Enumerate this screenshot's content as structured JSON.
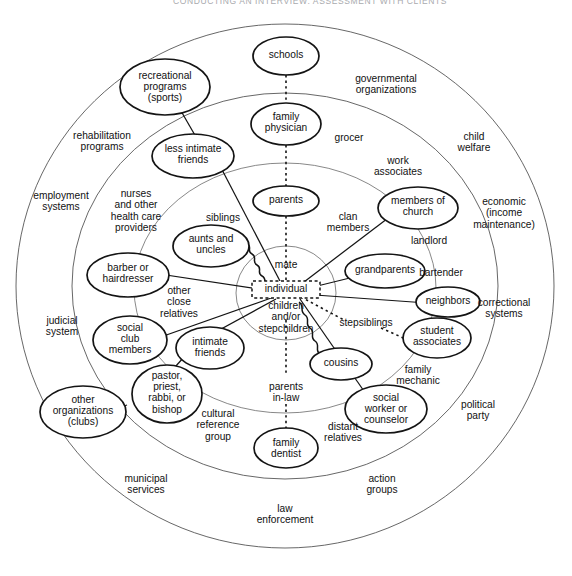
{
  "header": {
    "running_head": "CONDUCTING AN INTERVIEW: ASSESSMENT WITH CLIENTS"
  },
  "diagram": {
    "type": "ecomap",
    "center_label": "individual",
    "rings": [
      {
        "name": "nuclear-family-circle",
        "label": ""
      },
      {
        "name": "extended-family-ring",
        "label": ""
      },
      {
        "name": "informal-supports-ring",
        "label": ""
      },
      {
        "name": "formal-organizations-ring",
        "label": ""
      }
    ],
    "center": {
      "individual": "individual",
      "mate": "mate",
      "children": "children\nand/or\nstepchildren"
    },
    "inner_labels": [
      {
        "name": "mate",
        "text": "mate"
      },
      {
        "name": "children-or-stepchildren",
        "text": "children and/or stepchildren"
      }
    ],
    "family_ring_labels": [
      {
        "name": "siblings",
        "text": "siblings"
      },
      {
        "name": "clan-members",
        "text": "clan members"
      },
      {
        "name": "other-close-relatives",
        "text": "other close relatives"
      },
      {
        "name": "stepsiblings",
        "text": "stepsiblings"
      },
      {
        "name": "parents-in-law",
        "text": "parents in-law"
      },
      {
        "name": "distant-relatives",
        "text": "distant relatives"
      }
    ],
    "informal_ring_labels": [
      {
        "name": "grocer",
        "text": "grocer"
      },
      {
        "name": "work-associates",
        "text": "work associates"
      },
      {
        "name": "landlord",
        "text": "landlord"
      },
      {
        "name": "bartender",
        "text": "bartender"
      },
      {
        "name": "family-mechanic",
        "text": "family mechanic"
      },
      {
        "name": "cultural-reference-group",
        "text": "cultural reference group"
      },
      {
        "name": "nurses-and-other-health-care-providers",
        "text": "nurses and other health care providers"
      }
    ],
    "formal_ring_labels": [
      {
        "name": "governmental-organizations",
        "text": "governmental organizations"
      },
      {
        "name": "child-welfare",
        "text": "child welfare"
      },
      {
        "name": "economic-income-maintenance",
        "text": "economic (income maintenance)"
      },
      {
        "name": "correctional-systems",
        "text": "correctional systems"
      },
      {
        "name": "political-party",
        "text": "political party"
      },
      {
        "name": "action-groups",
        "text": "action groups"
      },
      {
        "name": "law-enforcement",
        "text": "law enforcement"
      },
      {
        "name": "municipal-services",
        "text": "municipal services"
      },
      {
        "name": "judicial-system",
        "text": "judicial system"
      },
      {
        "name": "employment-systems",
        "text": "employment systems"
      },
      {
        "name": "rehabilitation-programs",
        "text": "rehabilitation programs"
      }
    ],
    "nodes": [
      {
        "name": "schools",
        "text": "schools"
      },
      {
        "name": "recreational-programs-sports",
        "text": "recreational programs (sports)"
      },
      {
        "name": "family-physician",
        "text": "family physician"
      },
      {
        "name": "less-intimate-friends",
        "text": "less intimate friends"
      },
      {
        "name": "parents",
        "text": "parents"
      },
      {
        "name": "members-of-church",
        "text": "members of church"
      },
      {
        "name": "aunts-and-uncles",
        "text": "aunts and uncles"
      },
      {
        "name": "barber-or-hairdresser",
        "text": "barber or hairdresser"
      },
      {
        "name": "grandparents",
        "text": "grandparents"
      },
      {
        "name": "neighbors",
        "text": "neighbors"
      },
      {
        "name": "student-associates",
        "text": "student associates"
      },
      {
        "name": "social-club-members",
        "text": "social club members"
      },
      {
        "name": "intimate-friends",
        "text": "intimate friends"
      },
      {
        "name": "cousins",
        "text": "cousins"
      },
      {
        "name": "pastor-priest-rabbi-or-bishop",
        "text": "pastor, priest, rabbi, or bishop"
      },
      {
        "name": "other-organizations-clubs",
        "text": "other organizations (clubs)"
      },
      {
        "name": "social-worker-or-counselor",
        "text": "social worker or counselor"
      },
      {
        "name": "family-dentist",
        "text": "family dentist"
      }
    ],
    "connections": [
      {
        "from": "schools",
        "to": "family-physician",
        "style": "dotted"
      },
      {
        "from": "family-physician",
        "to": "parents",
        "style": "dotted"
      },
      {
        "from": "parents",
        "to": "individual",
        "style": "dotted"
      },
      {
        "from": "individual",
        "to": "parents-in-law",
        "style": "dotted"
      },
      {
        "from": "parents-in-law",
        "to": "family-dentist",
        "style": "dotted"
      },
      {
        "from": "individual",
        "to": "stepsiblings",
        "style": "dotted"
      },
      {
        "from": "individual",
        "to": "grandparents",
        "style": "solid"
      },
      {
        "from": "individual",
        "to": "neighbors",
        "style": "solid"
      },
      {
        "from": "individual",
        "to": "members-of-church",
        "style": "solid"
      },
      {
        "from": "individual",
        "to": "less-intimate-friends",
        "style": "solid"
      },
      {
        "from": "individual",
        "to": "barber-or-hairdresser",
        "style": "solid"
      },
      {
        "from": "individual",
        "to": "social-club-members",
        "style": "solid"
      },
      {
        "from": "individual",
        "to": "intimate-friends",
        "style": "solid"
      },
      {
        "from": "individual",
        "to": "social-worker-or-counselor",
        "style": "solid"
      },
      {
        "from": "individual",
        "to": "aunts-and-uncles",
        "style": "squiggle"
      },
      {
        "from": "individual",
        "to": "cousins",
        "style": "squiggle"
      },
      {
        "from": "recreational-programs-sports",
        "to": "less-intimate-friends",
        "style": "solid"
      },
      {
        "from": "intimate-friends",
        "to": "pastor-priest-rabbi-or-bishop",
        "style": "solid"
      },
      {
        "from": "pastor-priest-rabbi-or-bishop",
        "to": "other-organizations-clubs",
        "style": "solid"
      },
      {
        "from": "student-associates",
        "to": "stepsiblings",
        "style": "dotted"
      }
    ]
  }
}
